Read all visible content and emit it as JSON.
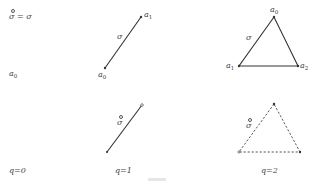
{
  "figure": {
    "definition_label": "= σ",
    "definition_symbol": "σ",
    "column_labels": [
      "q=0",
      "q=1",
      "q=2"
    ],
    "row_top": {
      "q0": {
        "vertex_label": "a",
        "vertex_sub": "0"
      },
      "q1": {
        "edge_label": "σ",
        "vertices": [
          {
            "label": "a",
            "sub": "0"
          },
          {
            "label": "a",
            "sub": "1"
          }
        ]
      },
      "q2": {
        "edge_label": "σ",
        "vertices": [
          {
            "label": "a",
            "sub": "0"
          },
          {
            "label": "a",
            "sub": "1"
          },
          {
            "label": "a",
            "sub": "2"
          }
        ]
      }
    },
    "row_bottom": {
      "q1": {
        "edge_label": "σ",
        "style": "solid",
        "dual": true
      },
      "q2": {
        "edge_label": "σ",
        "style": "dashed",
        "dual": true
      }
    },
    "colors": {
      "stroke": "#333333",
      "text": "#444444",
      "background": "#ffffff"
    }
  }
}
